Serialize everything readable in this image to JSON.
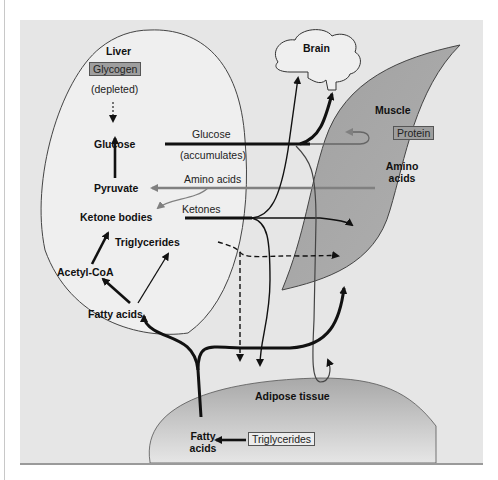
{
  "figure": {
    "organs": {
      "liver": "Liver",
      "brain": "Brain",
      "muscle": "Muscle",
      "adipose": "Adipose tissue"
    },
    "liver": {
      "glycogen": "Glycogen",
      "depleted": "(depleted)",
      "glucose": "Glucose",
      "pyruvate": "Pyruvate",
      "ketone_bodies": "Ketone bodies",
      "triglycerides": "Triglycerides",
      "acetyl_coa": "Acetyl-CoA",
      "fatty_acids": "Fatty acids"
    },
    "pathways": {
      "glucose": "Glucose",
      "accumulates": "(accumulates)",
      "amino_acids": "Amino acids",
      "ketones": "Ketones"
    },
    "muscle": {
      "protein": "Protein",
      "amino": "Amino",
      "acids": "acids"
    },
    "adipose": {
      "fatty": "Fatty",
      "acids": "acids",
      "triglycerides": "Triglycerides"
    },
    "colors": {
      "background": "#e6e6e6",
      "liver_fill": "#efefef",
      "muscle_fill": "#a8a8a8",
      "adipose_fill": "#b4b4b4",
      "box_dark": "#9e9e9e",
      "arrow_gray": "#808080",
      "arrow_black": "#111111"
    }
  }
}
